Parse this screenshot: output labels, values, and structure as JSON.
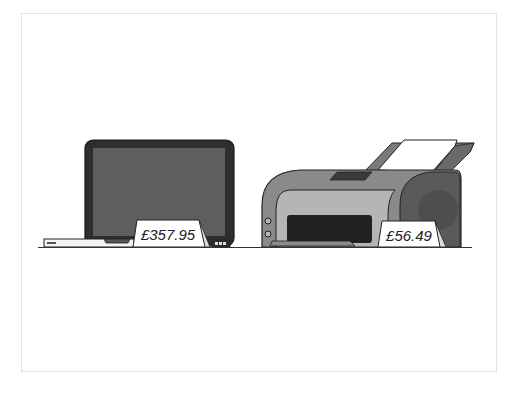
{
  "scene": {
    "description": "Illustration of a laptop and a printer on a shelf with price tags",
    "items": [
      {
        "name": "laptop",
        "price": "£357.95"
      },
      {
        "name": "printer",
        "price": "£56.49"
      }
    ]
  },
  "colors": {
    "frame_border": "#e2e2e2",
    "outline": "#222222",
    "laptop_bezel": "#2e2e2e",
    "laptop_screen": "#5e5e5e",
    "laptop_base": "#f4f4f4",
    "printer_body": "#8a8a8a",
    "printer_front": "#b5b5b5",
    "printer_side": "#555555",
    "printer_slot": "#222222",
    "paper": "#ffffff",
    "tag_bg": "#ffffff",
    "ground_line": "#333333"
  }
}
